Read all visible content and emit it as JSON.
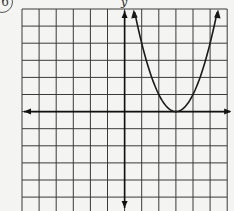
{
  "problem": {
    "number": "6"
  },
  "chart_data": {
    "type": "line",
    "title": "",
    "xlabel": "x",
    "ylabel": "y",
    "xlim": [
      -6,
      6
    ],
    "ylim": [
      -6,
      6
    ],
    "grid": true,
    "grid_unit": 1,
    "function": "y = (x - 3)^2",
    "vertex": [
      3,
      0
    ],
    "series": [
      {
        "name": "parabola",
        "x": [
          0.6,
          1,
          2,
          3,
          4,
          5,
          5.4
        ],
        "values": [
          5.76,
          4,
          1,
          0,
          1,
          4,
          5.76
        ]
      }
    ],
    "arrows_on_ends": true
  },
  "colors": {
    "grid": "#3a3a3a",
    "axis": "#111111",
    "curve": "#1a1a1a",
    "paper": "#f4f4f2"
  }
}
